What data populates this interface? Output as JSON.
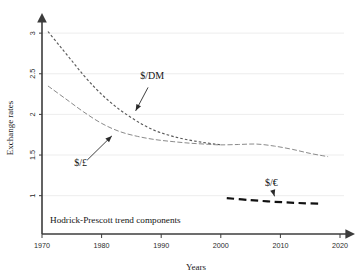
{
  "chart_data": {
    "type": "line",
    "title": "",
    "annotation": "Hodrick-Prescott trend components",
    "xlabel": "Years",
    "ylabel": "Exchange rates",
    "xlim": [
      1970,
      2020
    ],
    "ylim": [
      0.75,
      3.1
    ],
    "grid": true,
    "legend_position": "inline-annotations",
    "xticks": [
      "1970",
      "1980",
      "1990",
      "2000",
      "2010",
      "2020"
    ],
    "xtick_values": [
      1970,
      1980,
      1990,
      2000,
      2010,
      2020
    ],
    "yticks": [
      "1",
      "1.5",
      "2",
      "2.5",
      "3"
    ],
    "ytick_values": [
      1,
      1.5,
      2,
      2.5,
      3
    ],
    "series": [
      {
        "name": "$/DM",
        "label": "$/DM",
        "style": "fine-dashed",
        "color": "#5a5a5a",
        "x": [
          1971,
          1973,
          1975,
          1977,
          1979,
          1981,
          1983,
          1985,
          1987,
          1989,
          1991,
          1993,
          1995,
          1997,
          1999,
          2000
        ],
        "y": [
          3.02,
          2.84,
          2.66,
          2.48,
          2.32,
          2.18,
          2.06,
          1.96,
          1.87,
          1.8,
          1.75,
          1.71,
          1.68,
          1.655,
          1.635,
          1.625
        ]
      },
      {
        "name": "$/£",
        "label": "$/£",
        "style": "dashed",
        "color": "#8a8a8a",
        "x": [
          1971,
          1974,
          1977,
          1980,
          1983,
          1986,
          1989,
          1992,
          1995,
          1998,
          2000,
          2003,
          2006,
          2009,
          2012,
          2015,
          2018
        ],
        "y": [
          2.35,
          2.19,
          2.03,
          1.89,
          1.79,
          1.73,
          1.69,
          1.665,
          1.645,
          1.632,
          1.625,
          1.63,
          1.635,
          1.61,
          1.57,
          1.52,
          1.48
        ]
      },
      {
        "name": "$/€",
        "label": "$/€",
        "style": "thick-dashed",
        "color": "#111111",
        "x": [
          2001,
          2005,
          2009,
          2013,
          2017
        ],
        "y": [
          0.97,
          0.945,
          0.925,
          0.91,
          0.9
        ]
      }
    ],
    "annotations": [
      {
        "text": "$/DM",
        "label_x": 1988.5,
        "label_y": 2.43,
        "target_x": 1985.4,
        "target_y": 2.0
      },
      {
        "text": "$/£",
        "label_x": 1976.5,
        "label_y": 1.36,
        "target_x": 1982.2,
        "target_y": 1.77
      },
      {
        "text": "$/€",
        "label_x": 2008.5,
        "label_y": 1.12,
        "target_x": 2009.2,
        "target_y": 0.945
      }
    ]
  },
  "figure": {
    "axis_arrow_x_name": "x-axis-arrow",
    "axis_arrow_y_name": "y-axis-arrow"
  }
}
